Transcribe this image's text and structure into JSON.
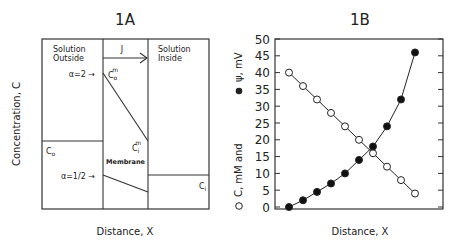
{
  "chart_data": [
    {
      "type": "diagram",
      "title": "1A",
      "xlabel": "Distance, X",
      "ylabel": "Concentration, C",
      "regions": [
        "Solution Outside",
        "Membrane",
        "Solution Inside"
      ],
      "annotations": {
        "flux": "J",
        "alpha_high": "α=2 →",
        "alpha_low": "α=1/2 →",
        "c_outside": "C",
        "c_outside_sub": "o",
        "c_inside": "C",
        "c_inside_sub": "i",
        "c_mem_out": "C",
        "c_mem_out_sub": "o",
        "c_mem_out_sup": "m",
        "c_mem_in": "C",
        "c_mem_in_sub": "i",
        "c_mem_in_sup": "m",
        "membrane": "Membrane"
      }
    },
    {
      "type": "line",
      "title": "1B",
      "xlabel": "Distance, X",
      "ylabel": "○ C, mM and ● ψ, mV",
      "ylabel_parts": {
        "open": "o",
        "c": "C, mM and",
        "filled": "●",
        "psi": "ψ, mV"
      },
      "ylim": [
        0,
        50
      ],
      "yticks": [
        0,
        5,
        10,
        15,
        20,
        25,
        30,
        35,
        40,
        45,
        50
      ],
      "x": [
        1,
        2,
        3,
        4,
        5,
        6,
        7,
        8,
        9,
        10
      ],
      "series": [
        {
          "name": "C, mM (open circles)",
          "marker": "open",
          "values": [
            40,
            36,
            32,
            28,
            24,
            20,
            16,
            12,
            8,
            4
          ]
        },
        {
          "name": "ψ, mV (filled circles)",
          "marker": "filled",
          "values": [
            0,
            2,
            4.5,
            7,
            10,
            14,
            18,
            24,
            32,
            46
          ]
        }
      ],
      "grid": false
    }
  ]
}
